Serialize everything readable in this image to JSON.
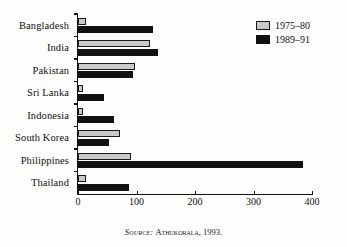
{
  "chart_data": {
    "type": "bar",
    "orientation": "horizontal",
    "title": "",
    "xlabel": "",
    "ylabel": "",
    "xlim": [
      0,
      400
    ],
    "xticks": [
      0,
      100,
      200,
      300,
      400
    ],
    "grid": false,
    "legend_position": "top-right",
    "categories": [
      "Bangladesh",
      "India",
      "Pakistan",
      "Sri Lanka",
      "Indonesia",
      "South Korea",
      "Philippines",
      "Thailand"
    ],
    "series": [
      {
        "name": "1975–80",
        "color": "#c9c9c9",
        "values": [
          14,
          123,
          98,
          8,
          8,
          72,
          90,
          13
        ]
      },
      {
        "name": "1989–91",
        "color": "#111111",
        "values": [
          128,
          137,
          94,
          45,
          62,
          53,
          385,
          88
        ]
      }
    ]
  },
  "legend": {
    "items": [
      {
        "label": "1975–80",
        "swatch": "light-swatch-icon"
      },
      {
        "label": "1989–91",
        "swatch": "dark-swatch-icon"
      }
    ]
  },
  "source": {
    "prefix": "Source:",
    "text": "Athukorala, 1993."
  }
}
